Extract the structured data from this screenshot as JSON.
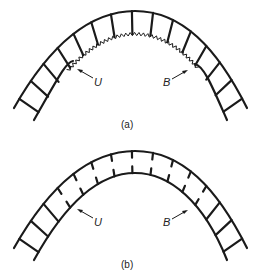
{
  "figure": {
    "panels": [
      {
        "id": "a",
        "caption": "(a)",
        "interface": "zigzag",
        "labels": {
          "left": "U",
          "right": "B"
        }
      },
      {
        "id": "b",
        "caption": "(b)",
        "interface": "broken-rungs",
        "labels": {
          "left": "U",
          "right": "B"
        }
      }
    ],
    "stroke_color": "#1a1a1a"
  }
}
